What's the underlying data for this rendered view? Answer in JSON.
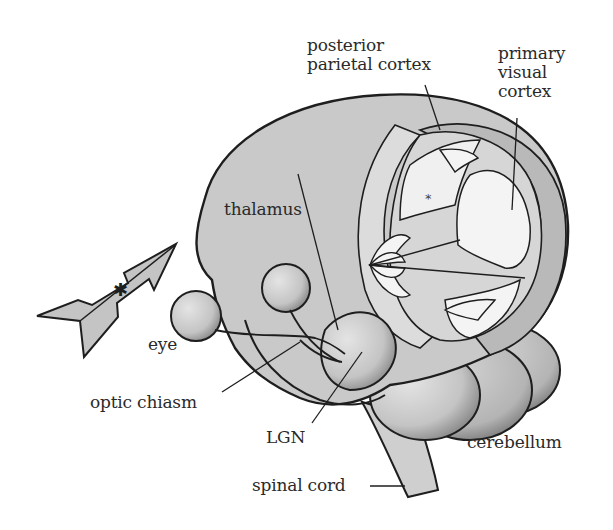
{
  "figure": {
    "colors": {
      "background": "#ffffff",
      "brain_fill": "#c9c9c9",
      "inner_fill": "#dcdcdc",
      "light_fill": "#f2f2f2",
      "dark_fill": "#a9a9a9",
      "outline": "#1e1e1e",
      "text": "#2a2a2a"
    },
    "labels": {
      "posterior_parietal_cortex": "posterior\nparietal cortex",
      "primary_visual_cortex": "primary\nvisual\ncortex",
      "thalamus": "thalamus",
      "eye": "eye",
      "optic_chiasm": "optic chiasm",
      "lgn": "LGN",
      "cerebellum": "cerebellum",
      "spinal_cord": "spinal cord"
    },
    "markers": {
      "asterisk": "*",
      "arrow_cross": "✱"
    }
  }
}
